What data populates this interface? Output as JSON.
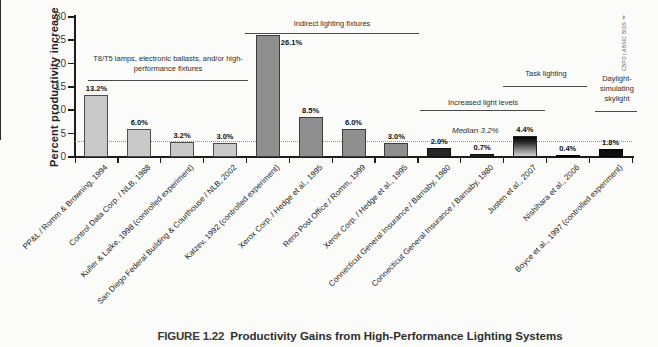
{
  "figure": {
    "caption_label": "FIGURE 1.22",
    "caption_title": "Productivity Gains from High-Performance Lighting Systems",
    "source_vertical": "CBPD | ABSIC BIDS ™"
  },
  "chart_data": {
    "type": "bar",
    "title": "",
    "xlabel": "",
    "ylabel": "Percent productivity increase",
    "ylim": [
      0,
      30
    ],
    "yticks": [
      0,
      5,
      10,
      15,
      20,
      25,
      30
    ],
    "grid": false,
    "legend": "none",
    "categories": [
      "PP&L / Romm & Browning, 1994",
      "Control Data Corp. / NLB, 1988",
      "Kuller & Laike, 1998 (controlled experiment)",
      "San Diego Federal Building & Courthouse / NLB, 2002",
      "Katzev, 1992 (controlled experiment)",
      "Xerox Corp. / Hedge et al., 1995",
      "Reno Post Office / Romm, 1999",
      "Xerox Corp. / Hedge et al., 1995",
      "Connecticut General Insurance / Barnaby, 1980",
      "Connecticut General Insurance / Barnaby, 1980",
      "Justen et al., 2007",
      "Nishihara et al., 2006",
      "Boyce et al., 1997 (controlled experiment)"
    ],
    "values": [
      13.2,
      6.0,
      3.2,
      3.0,
      26.1,
      8.5,
      6.0,
      3.0,
      2.0,
      0.7,
      4.4,
      0.4,
      1.8
    ],
    "value_labels": [
      "13.2%",
      "6.0%",
      "3.2%",
      "3.0%",
      "26.1%",
      "8.5%",
      "6.0%",
      "3.0%",
      "2.0%",
      "0.7%",
      "4.4%",
      "0.4%",
      "1.8%"
    ],
    "bar_styles": [
      "light",
      "light",
      "light",
      "light",
      "medium",
      "medium",
      "medium",
      "medium",
      "dark",
      "dark",
      "gradient",
      "black",
      "black"
    ],
    "palette": {
      "light": "#c9c9c9",
      "medium": "#8f8f8f",
      "dark": "#262626",
      "black": "#0e0e0e",
      "gradient_top": "#000000",
      "gradient_bottom": "#d0d0d0"
    },
    "median": {
      "label": "Median 3.2%",
      "value": 3.2
    },
    "groups": [
      {
        "label": "T8/T5 lamps, electronic ballasts, and/or high-performance fixtures",
        "bar_start": 0,
        "bar_end": 3
      },
      {
        "label": "Indirect lighting fixtures",
        "bar_start": 4,
        "bar_end": 7
      },
      {
        "label": "Increased light levels",
        "bar_start": 8,
        "bar_end": 9
      },
      {
        "label": "Task lighting",
        "bar_start": 10,
        "bar_end": 11
      },
      {
        "label": "Daylight-simulating skylight",
        "bar_start": 12,
        "bar_end": 12
      }
    ]
  }
}
